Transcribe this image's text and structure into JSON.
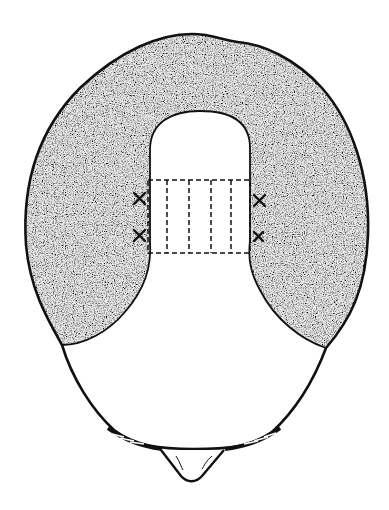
{
  "diagram": {
    "subject": "Top view of head showing hair transplant donor/recipient zones",
    "regions": [
      {
        "name": "hair-bearing-fringe",
        "fill": "stippled-gray"
      },
      {
        "name": "bald-crown",
        "fill": "#ffffff"
      },
      {
        "name": "dashed-graft-strip-grid",
        "columns": 5
      }
    ],
    "markers": [
      {
        "name": "x-mark",
        "side": "left",
        "count": 2
      },
      {
        "name": "x-mark",
        "side": "right",
        "count": 2
      }
    ],
    "colors": {
      "outline": "#111111",
      "stipple_dark": "#3a3a3a",
      "stipple_light": "#9a9a9a",
      "background": "#ffffff"
    }
  }
}
